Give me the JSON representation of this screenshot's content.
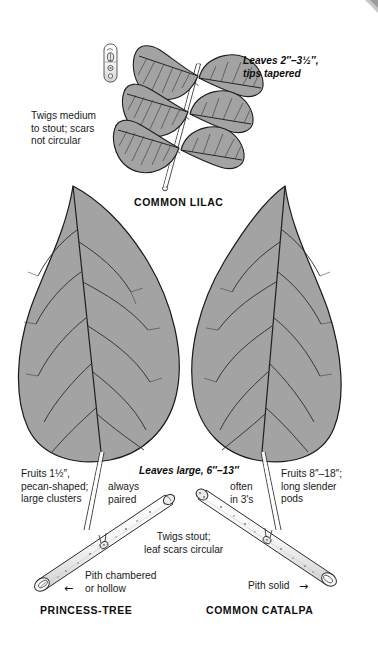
{
  "plate": {
    "title_hidden": "",
    "background_color": "#ffffff",
    "leaf_fill": "#a3a3a3",
    "leaf_fill_light": "#ababab",
    "ink_color": "#111111",
    "vein_color": "#2a2a2a"
  },
  "captions": {
    "common_lilac": "COMMON LILAC",
    "princess_tree": "PRINCESS-TREE",
    "common_catalpa": "COMMON CATALPA"
  },
  "annotations": {
    "lilac_leaves": "Leaves 2″–3½″,\ntips tapered",
    "lilac_twigs": "Twigs medium\nto stout; scars\nnot circular",
    "fruits_left": "Fruits 1½″,\npecan-shaped;\nlarge clusters",
    "always_paired": "always\npaired",
    "leaves_large": "Leaves large, 6″–13″",
    "often_in_threes": "often\nin 3's",
    "fruits_right": "Fruits 8″–18″;\nlong slender\npods",
    "twigs_stout": "Twigs stout;\nleaf scars circular",
    "pith_chambered": "Pith chambered\nor hollow",
    "pith_solid": "Pith solid",
    "arrow_left_glyph": "←",
    "arrow_right_glyph": "→"
  },
  "figures": {
    "lilac_twig_inset": "lilac-twig-inset",
    "lilac_spray": "lilac-leaf-spray",
    "leaf_princess_tree": "princess-tree-leaf",
    "leaf_catalpa": "catalpa-leaf",
    "twig_princess_tree": "princess-tree-twig",
    "twig_catalpa": "catalpa-twig"
  }
}
